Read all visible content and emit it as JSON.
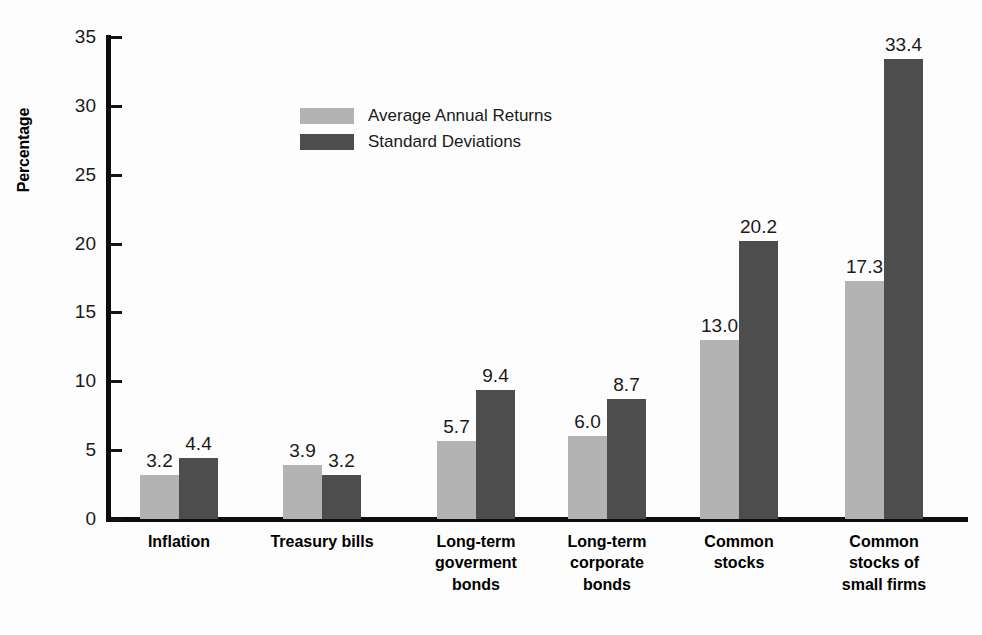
{
  "chart_data": {
    "type": "bar",
    "title": "",
    "xlabel": "",
    "ylabel": "Percentage",
    "ylim": [
      0,
      35
    ],
    "yticks": [
      0,
      5,
      10,
      15,
      20,
      25,
      30,
      35
    ],
    "grid": false,
    "legend_position": "upper-left-inside",
    "categories": [
      "Inflation",
      "Treasury bills",
      "Long-term goverment bonds",
      "Long-term corporate bonds",
      "Common stocks",
      "Common stocks of small firms"
    ],
    "category_lines": [
      [
        "Inflation"
      ],
      [
        "Treasury bills"
      ],
      [
        "Long-term",
        "goverment",
        "bonds"
      ],
      [
        "Long-term",
        "corporate",
        "bonds"
      ],
      [
        "Common",
        "stocks"
      ],
      [
        "Common",
        "stocks of",
        "small firms"
      ]
    ],
    "series": [
      {
        "name": "Average Annual Returns",
        "color": "#b3b3b3",
        "values": [
          3.2,
          3.9,
          5.7,
          6.0,
          13.0,
          17.3
        ],
        "labels": [
          "3.2",
          "3.9",
          "5.7",
          "6.0",
          "13.0",
          "17.3"
        ]
      },
      {
        "name": "Standard Deviations",
        "color": "#4d4d4d",
        "values": [
          4.4,
          3.2,
          9.4,
          8.7,
          20.2,
          33.4
        ],
        "labels": [
          "4.4",
          "3.2",
          "9.4",
          "8.7",
          "20.2",
          "33.4"
        ]
      }
    ]
  },
  "axis": {
    "y_title": "Percentage",
    "y_tick_labels": [
      "35",
      "30",
      "25",
      "20",
      "15",
      "10",
      "5",
      "0"
    ]
  },
  "legend": {
    "items": [
      {
        "label": "Average Annual Returns",
        "color": "#b3b3b3"
      },
      {
        "label": "Standard Deviations",
        "color": "#4d4d4d"
      }
    ]
  },
  "layout": {
    "group_left_px": [
      29,
      172,
      326,
      457,
      589,
      734
    ],
    "bar_width_px": 39,
    "plot_height_px": 482,
    "y_max": 35
  }
}
